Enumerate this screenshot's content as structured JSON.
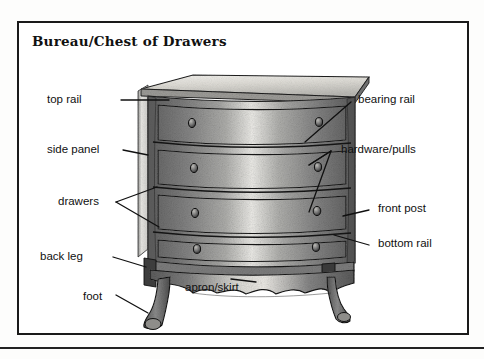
{
  "page": {
    "background_color": "#ffffff",
    "frame_border_color": "#1a1a1a",
    "rule_color": "#222222"
  },
  "figure": {
    "title": "Bureau/Chest of Drawers",
    "drawer_count": 4,
    "palette": {
      "wood_dark": "#6a6a6a",
      "wood_mid": "#8d8d8d",
      "wood_light": "#d8d8d6",
      "highlight": "#f0efec",
      "outline": "#1b1b1b",
      "leader_line": "#111111"
    }
  },
  "labels": [
    {
      "id": "top-rail",
      "text": "top rail",
      "side": "left",
      "x": 47,
      "y": 100
    },
    {
      "id": "side-panel",
      "text": "side panel",
      "side": "left",
      "x": 47,
      "y": 150
    },
    {
      "id": "drawers",
      "text": "drawers",
      "side": "left",
      "x": 58,
      "y": 202
    },
    {
      "id": "back-leg",
      "text": "back leg",
      "side": "left",
      "x": 40,
      "y": 257
    },
    {
      "id": "foot",
      "text": "foot",
      "side": "left",
      "x": 83,
      "y": 297
    },
    {
      "id": "apron-skirt",
      "text": "apron/skirt",
      "side": "left",
      "x": 185,
      "y": 288
    },
    {
      "id": "bearing-rail",
      "text": "bearing rail",
      "side": "right",
      "x": 335,
      "y": 100
    },
    {
      "id": "hardware-pulls",
      "text": "hardware/pulls",
      "side": "right",
      "x": 318,
      "y": 150
    },
    {
      "id": "front-post",
      "text": "front post",
      "side": "right",
      "x": 355,
      "y": 208
    },
    {
      "id": "bottom-rail",
      "text": "bottom rail",
      "side": "right",
      "x": 355,
      "y": 245
    }
  ],
  "leader_lines": [
    {
      "id": "top-rail-leader",
      "label": "top rail"
    },
    {
      "id": "side-panel-leader",
      "label": "side panel"
    },
    {
      "id": "drawers-leader",
      "label": "drawers"
    },
    {
      "id": "back-leg-leader",
      "label": "back leg"
    },
    {
      "id": "foot-leader",
      "label": "foot"
    },
    {
      "id": "apron-skirt-leader",
      "label": "apron/skirt"
    },
    {
      "id": "bearing-rail-leader",
      "label": "bearing rail"
    },
    {
      "id": "hardware-leader",
      "label": "hardware/pulls"
    },
    {
      "id": "front-post-leader",
      "label": "front post"
    },
    {
      "id": "bottom-rail-leader",
      "label": "bottom rail"
    }
  ]
}
